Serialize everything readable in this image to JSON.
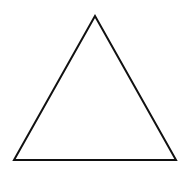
{
  "diagram": {
    "shape": "triangle",
    "type": "equilateral",
    "stroke_color": "#111111",
    "fill_color": "#ffffff",
    "stroke_width": 2,
    "vertices": {
      "apex": [
        95,
        16
      ],
      "bottom_left": [
        14,
        160
      ],
      "bottom_right": [
        176,
        160
      ]
    }
  }
}
